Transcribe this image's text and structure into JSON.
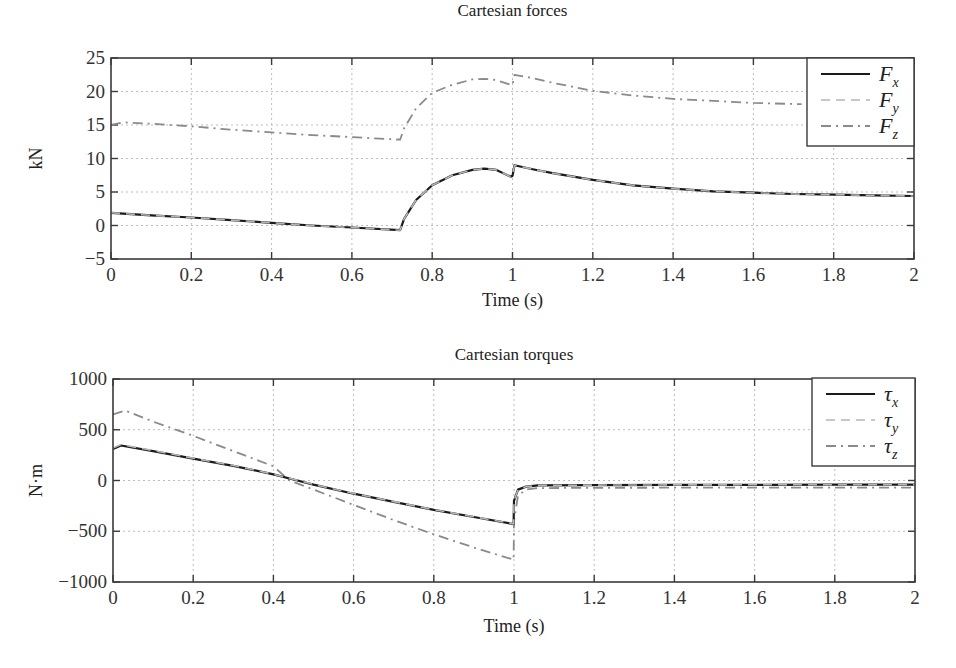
{
  "figure": {
    "width": 956,
    "height": 668,
    "colors": {
      "series_solid": "#1a1a1a",
      "series_dashed_light": "#b5b5b5",
      "series_dashdot": "#8a8a8a",
      "grid": "#bdbdbd",
      "frame": "#3a3a3a"
    }
  },
  "chart_data": [
    {
      "type": "line",
      "title": "Cartesian forces",
      "xlabel": "Time (s)",
      "ylabel": "kN",
      "xlim": [
        0,
        2
      ],
      "ylim": [
        -5,
        25
      ],
      "xticks": [
        0,
        0.2,
        0.4,
        0.6,
        0.8,
        1,
        1.2,
        1.4,
        1.6,
        1.8,
        2
      ],
      "xtick_labels": [
        "0",
        "0.2",
        "0.4",
        "0.6",
        "0.8",
        "1",
        "1.2",
        "1.4",
        "1.6",
        "1.8",
        "2"
      ],
      "yticks": [
        -5,
        0,
        5,
        10,
        15,
        20,
        25
      ],
      "ytick_labels": [
        "−5",
        "0",
        "5",
        "10",
        "15",
        "20",
        "25"
      ],
      "grid": true,
      "legend_position": "upper right",
      "legend": [
        {
          "label": "F",
          "sub": "x",
          "style": "solid"
        },
        {
          "label": "F",
          "sub": "y",
          "style": "dashed"
        },
        {
          "label": "F",
          "sub": "z",
          "style": "dashdot"
        }
      ],
      "series": [
        {
          "name": "Fx",
          "style": "solid",
          "x": [
            0,
            0.1,
            0.2,
            0.3,
            0.4,
            0.5,
            0.6,
            0.72,
            0.73,
            0.76,
            0.8,
            0.85,
            0.9,
            0.93,
            0.96,
            0.995,
            1.0,
            1.005,
            1.05,
            1.1,
            1.2,
            1.3,
            1.4,
            1.5,
            1.6,
            1.7,
            1.8,
            1.9,
            2.0
          ],
          "values": [
            1.9,
            1.5,
            1.2,
            0.8,
            0.4,
            0.0,
            -0.3,
            -0.7,
            1.0,
            3.8,
            6.0,
            7.5,
            8.3,
            8.5,
            8.3,
            7.3,
            7.4,
            9.0,
            8.4,
            7.8,
            6.8,
            6.0,
            5.5,
            5.1,
            4.9,
            4.7,
            4.6,
            4.5,
            4.4
          ]
        },
        {
          "name": "Fy",
          "style": "dashed",
          "x": [
            0,
            0.1,
            0.2,
            0.3,
            0.4,
            0.5,
            0.6,
            0.72,
            0.73,
            0.76,
            0.8,
            0.85,
            0.9,
            0.93,
            0.96,
            0.995,
            1.0,
            1.005,
            1.05,
            1.1,
            1.2,
            1.3,
            1.4,
            1.5,
            1.6,
            1.7,
            1.8,
            1.9,
            2.0
          ],
          "values": [
            1.9,
            1.5,
            1.2,
            0.8,
            0.4,
            0.0,
            -0.3,
            -0.7,
            1.0,
            3.8,
            6.0,
            7.5,
            8.3,
            8.5,
            8.3,
            7.3,
            7.4,
            9.0,
            8.4,
            7.8,
            6.8,
            6.0,
            5.5,
            5.1,
            4.9,
            4.7,
            4.6,
            4.5,
            4.4
          ]
        },
        {
          "name": "Fz",
          "style": "dashdot",
          "x": [
            0,
            0.03,
            0.1,
            0.2,
            0.3,
            0.4,
            0.5,
            0.6,
            0.72,
            0.73,
            0.76,
            0.8,
            0.85,
            0.9,
            0.93,
            0.96,
            0.995,
            1.0,
            1.005,
            1.05,
            1.1,
            1.2,
            1.3,
            1.4,
            1.5,
            1.6,
            1.72
          ],
          "values": [
            15.0,
            15.4,
            15.2,
            14.8,
            14.3,
            13.9,
            13.5,
            13.2,
            12.8,
            14.5,
            17.5,
            19.8,
            21.0,
            21.8,
            21.9,
            21.7,
            21.0,
            21.0,
            22.5,
            22.0,
            21.3,
            20.1,
            19.4,
            18.9,
            18.6,
            18.3,
            18.1
          ]
        }
      ]
    },
    {
      "type": "line",
      "title": "Cartesian torques",
      "xlabel": "Time (s)",
      "ylabel": "N·m",
      "xlim": [
        0,
        2
      ],
      "ylim": [
        -1000,
        1000
      ],
      "xticks": [
        0,
        0.2,
        0.4,
        0.6,
        0.8,
        1,
        1.2,
        1.4,
        1.6,
        1.8,
        2
      ],
      "xtick_labels": [
        "0",
        "0.2",
        "0.4",
        "0.6",
        "0.8",
        "1",
        "1.2",
        "1.4",
        "1.6",
        "1.8",
        "2"
      ],
      "yticks": [
        -1000,
        -500,
        0,
        500,
        1000
      ],
      "ytick_labels": [
        "−1000",
        "−500",
        "0",
        "500",
        "1000"
      ],
      "grid": true,
      "legend_position": "upper right",
      "legend": [
        {
          "label": "τ",
          "sub": "x",
          "style": "solid"
        },
        {
          "label": "τ",
          "sub": "y",
          "style": "dashed"
        },
        {
          "label": "τ",
          "sub": "z",
          "style": "dashdot"
        }
      ],
      "series": [
        {
          "name": "τx",
          "style": "solid",
          "x": [
            0,
            0.02,
            0.1,
            0.2,
            0.3,
            0.4,
            0.45,
            0.5,
            0.6,
            0.7,
            0.8,
            0.9,
            0.999,
            1.0,
            1.01,
            1.03,
            1.06,
            1.2,
            1.4,
            1.6,
            1.8,
            2.0
          ],
          "values": [
            310,
            345,
            290,
            215,
            145,
            60,
            10,
            -40,
            -130,
            -210,
            -290,
            -360,
            -430,
            -200,
            -90,
            -60,
            -48,
            -45,
            -43,
            -42,
            -41,
            -40
          ]
        },
        {
          "name": "τy",
          "style": "dashed",
          "x": [
            0,
            0.02,
            0.1,
            0.2,
            0.3,
            0.4,
            0.45,
            0.5,
            0.6,
            0.7,
            0.8,
            0.9,
            0.999,
            1.0,
            1.01,
            1.03,
            1.06,
            1.2,
            1.4,
            1.6,
            1.8,
            2.0
          ],
          "values": [
            320,
            355,
            295,
            220,
            148,
            62,
            12,
            -38,
            -128,
            -208,
            -288,
            -358,
            -428,
            -200,
            -90,
            -60,
            -48,
            -45,
            -43,
            -42,
            -41,
            -40
          ]
        },
        {
          "name": "τz",
          "style": "dashdot",
          "x": [
            0,
            0.03,
            0.1,
            0.2,
            0.3,
            0.4,
            0.44,
            0.5,
            0.6,
            0.7,
            0.8,
            0.9,
            0.999,
            1.0,
            1.01,
            1.03,
            1.06,
            1.2,
            1.4,
            1.6,
            1.8,
            2.0
          ],
          "values": [
            650,
            690,
            580,
            440,
            290,
            140,
            0,
            -90,
            -240,
            -390,
            -530,
            -660,
            -780,
            -400,
            -150,
            -90,
            -75,
            -72,
            -71,
            -70,
            -70,
            -70
          ]
        }
      ]
    }
  ]
}
